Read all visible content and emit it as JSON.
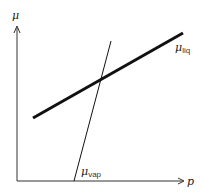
{
  "diagram": {
    "axes": {
      "y_label": "μ",
      "x_label": "p"
    },
    "curves": [
      {
        "id": "liq",
        "label_main": "μ",
        "label_sub": "liq",
        "style": "thick"
      },
      {
        "id": "vap",
        "label_main": "μ",
        "label_sub": "vap",
        "style": "thin"
      }
    ],
    "colors": {
      "line": "#111111",
      "axis": "#333333"
    }
  }
}
